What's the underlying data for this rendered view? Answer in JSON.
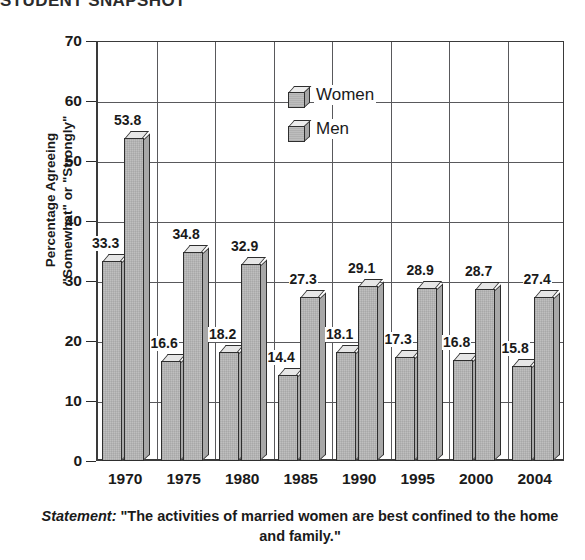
{
  "title": "STUDENT SNAPSHOT",
  "legend": {
    "position": "inside-top-center",
    "items": [
      {
        "label": "Women",
        "icon": "cube-icon"
      },
      {
        "label": "Men",
        "icon": "cube-icon"
      }
    ]
  },
  "caption": {
    "lead": "Statement:",
    "text": "\"The activities of married women are best confined to the home and family.\""
  },
  "chart_data": {
    "type": "bar",
    "title": "STUDENT SNAPSHOT",
    "xlabel": "",
    "ylabel": "Percentage Agreeing \"Somewhat\" or \"Strongly\"",
    "ylabel_lines": [
      "Percentage Agreeing",
      "\"Somewhat\" or \"Strongly\""
    ],
    "ylim": [
      0,
      70
    ],
    "yticks": [
      0,
      10,
      20,
      30,
      40,
      50,
      60,
      70
    ],
    "grid": true,
    "legend_position": "inside-top-center",
    "categories": [
      "1970",
      "1975",
      "1980",
      "1985",
      "1990",
      "1995",
      "2000",
      "2004"
    ],
    "series": [
      {
        "name": "Women",
        "values": [
          33.3,
          16.6,
          18.2,
          14.4,
          18.1,
          17.3,
          16.8,
          15.8
        ]
      },
      {
        "name": "Men",
        "values": [
          53.8,
          34.8,
          32.9,
          27.3,
          29.1,
          28.9,
          28.7,
          27.4
        ]
      }
    ]
  },
  "colors": {
    "bar_face": "#bfbfbf",
    "bar_top": "#e6e6e6",
    "bar_side": "#a8a8a8",
    "outline": "#2e2e2e",
    "grid": "#59595c",
    "axis": "#3a3a3a",
    "text": "#1a1a1a",
    "background": "#ffffff"
  }
}
